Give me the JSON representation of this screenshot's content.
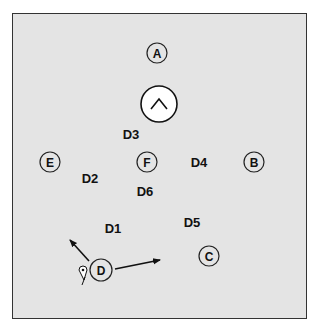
{
  "diagram": {
    "frame": {
      "x": 12,
      "y": 13,
      "w": 294,
      "h": 305,
      "fill": "#e4e4e4",
      "stroke": "#333333"
    },
    "circled_markers": [
      {
        "id": "A",
        "label": "A",
        "cx": 157,
        "cy": 53,
        "r": 10
      },
      {
        "id": "E",
        "label": "E",
        "cx": 50,
        "cy": 162,
        "r": 10
      },
      {
        "id": "F",
        "label": "F",
        "cx": 147,
        "cy": 162,
        "r": 10
      },
      {
        "id": "B",
        "label": "B",
        "cx": 254,
        "cy": 162,
        "r": 10
      },
      {
        "id": "C",
        "label": "C",
        "cx": 209,
        "cy": 256,
        "r": 10
      },
      {
        "id": "D",
        "label": "D",
        "cx": 101,
        "cy": 270,
        "r": 11
      }
    ],
    "center_symbol": {
      "name": "caret-up-icon",
      "cx": 159,
      "cy": 104,
      "r": 18
    },
    "labels": [
      {
        "id": "D1",
        "text": "D1",
        "x": 113,
        "y": 233
      },
      {
        "id": "D2",
        "text": "D2",
        "x": 90,
        "y": 183
      },
      {
        "id": "D3",
        "text": "D3",
        "x": 131,
        "y": 139
      },
      {
        "id": "D4",
        "text": "D4",
        "x": 199,
        "y": 167
      },
      {
        "id": "D5",
        "text": "D5",
        "x": 192,
        "y": 227
      },
      {
        "id": "D6",
        "text": "D6",
        "x": 145,
        "y": 196
      }
    ],
    "arrows": [
      {
        "name": "arrow-up-left",
        "x1": 89,
        "y1": 261,
        "x2": 70,
        "y2": 240
      },
      {
        "name": "arrow-right",
        "x1": 115,
        "y1": 269,
        "x2": 160,
        "y2": 260
      }
    ],
    "small_icon": {
      "name": "location-pin-icon",
      "x": 83,
      "y": 271
    }
  }
}
